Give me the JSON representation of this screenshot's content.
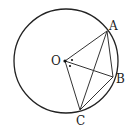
{
  "diagram": {
    "type": "geometry-circle",
    "circle": {
      "center_label": "O",
      "cx": 66,
      "cy": 61,
      "r": 52
    },
    "points": {
      "O": {
        "label": "O",
        "x": 65,
        "y": 61,
        "lx": 51,
        "ly": 65
      },
      "A": {
        "label": "A",
        "x": 107,
        "y": 31,
        "lx": 109,
        "ly": 30
      },
      "B": {
        "label": "B",
        "x": 113,
        "y": 77,
        "lx": 116,
        "ly": 83
      },
      "C": {
        "label": "C",
        "x": 80,
        "y": 110,
        "lx": 76,
        "ly": 125
      }
    },
    "segments": [
      [
        "O",
        "A"
      ],
      [
        "O",
        "B"
      ],
      [
        "O",
        "C"
      ],
      [
        "A",
        "B"
      ],
      [
        "A",
        "C"
      ],
      [
        "C",
        "B"
      ]
    ],
    "angle_marks": [
      {
        "description": "dot marking angle AOB",
        "x": 72,
        "y": 60
      },
      {
        "description": "dot marking angle BOC",
        "x": 70,
        "y": 66
      }
    ]
  }
}
